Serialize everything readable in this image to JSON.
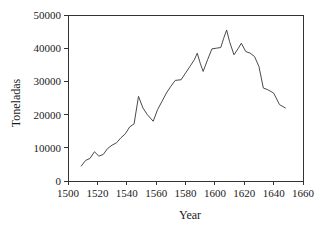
{
  "chart_data": {
    "type": "line",
    "title": "",
    "xlabel": "Year",
    "ylabel": "Toneladas",
    "xlim": [
      1500,
      1660
    ],
    "ylim": [
      0,
      50000
    ],
    "xticks": [
      1500,
      1520,
      1540,
      1560,
      1580,
      1600,
      1620,
      1640,
      1660
    ],
    "yticks": [
      0,
      10000,
      20000,
      30000,
      40000,
      50000
    ],
    "grid": false,
    "legend": null,
    "series": [
      {
        "name": "Toneladas",
        "color": "#4a4a4a",
        "x": [
          1509,
          1512,
          1515,
          1518,
          1521,
          1524,
          1527,
          1530,
          1533,
          1536,
          1539,
          1542,
          1545,
          1548,
          1551,
          1554,
          1558,
          1561,
          1564,
          1567,
          1570,
          1573,
          1577,
          1580,
          1583,
          1586,
          1588,
          1590,
          1592,
          1595,
          1598,
          1601,
          1604,
          1606,
          1608,
          1610,
          1613,
          1616,
          1618,
          1621,
          1624,
          1627,
          1630,
          1633,
          1636,
          1640,
          1644,
          1648
        ],
        "y": [
          4500,
          6200,
          6800,
          8800,
          7500,
          8000,
          9800,
          10800,
          11500,
          13000,
          14200,
          16300,
          17200,
          25500,
          22000,
          20000,
          18000,
          21500,
          24000,
          26500,
          28500,
          30300,
          30500,
          32500,
          34500,
          36500,
          38500,
          35500,
          33000,
          36500,
          39800,
          40000,
          40200,
          43000,
          45500,
          42000,
          38000,
          40000,
          41500,
          39000,
          38500,
          37500,
          34500,
          28000,
          27500,
          26500,
          23000,
          22000
        ]
      }
    ]
  },
  "axis": {
    "y_label": "Toneladas",
    "x_label": "Year",
    "y_tick_labels": [
      "0",
      "10000",
      "20000",
      "30000",
      "40000",
      "50000"
    ],
    "x_tick_labels": [
      "1500",
      "1520",
      "1540",
      "1560",
      "1580",
      "1600",
      "1620",
      "1640",
      "1660"
    ]
  },
  "colors": {
    "series": "#4a4a4a",
    "axis": "#333333",
    "text": "#1a1a1a",
    "background": "#ffffff"
  }
}
